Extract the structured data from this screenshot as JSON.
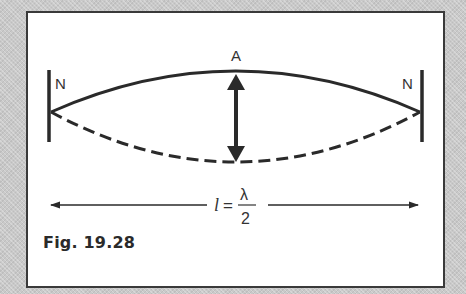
{
  "figure": {
    "caption": "Fig. 19.28",
    "labels": {
      "node_left": "N",
      "node_right": "N",
      "antinode": "A",
      "length_symbol": "l",
      "equals": "=",
      "numerator": "λ",
      "denominator": "2"
    },
    "colors": {
      "ink": "#2a2a2a",
      "frame_background": "#c9c9c9",
      "panel_background": "#ffffff"
    }
  }
}
